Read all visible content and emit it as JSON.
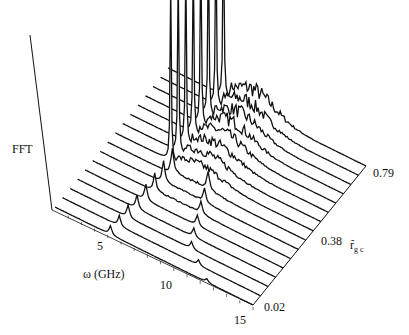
{
  "chart_data": {
    "type": "waterfall-3d",
    "title": "",
    "zlabel": "FFT",
    "xlabel": "ω (GHz)",
    "ylabel": "r̄_gc",
    "x_ticks": [
      5,
      10,
      15
    ],
    "x_tick_labels": [
      "5",
      "10",
      "15"
    ],
    "x_range": [
      0,
      15
    ],
    "y_ticks": [
      0.02,
      0.38,
      0.79
    ],
    "y_tick_labels": [
      "0.02",
      "0.38",
      "0.79"
    ],
    "y_range": [
      0.02,
      0.79
    ],
    "grid": false,
    "legend": null,
    "series_count": 16,
    "series": [
      {
        "r_gc": 0.02,
        "peaks": [
          {
            "omega": 4.2,
            "amp": 0.05
          },
          {
            "omega": 11.5,
            "amp": 0.02
          }
        ],
        "noise": 0.0
      },
      {
        "r_gc": 0.07,
        "peaks": [
          {
            "omega": 4.3,
            "amp": 0.06
          },
          {
            "omega": 10.3,
            "amp": 0.03
          }
        ],
        "noise": 0.0
      },
      {
        "r_gc": 0.12,
        "peaks": [
          {
            "omega": 4.4,
            "amp": 0.07
          },
          {
            "omega": 9.2,
            "amp": 0.04
          }
        ],
        "noise": 0.0
      },
      {
        "r_gc": 0.17,
        "peaks": [
          {
            "omega": 4.5,
            "amp": 0.08
          },
          {
            "omega": 8.8,
            "amp": 0.05
          }
        ],
        "noise": 0.0
      },
      {
        "r_gc": 0.22,
        "peaks": [
          {
            "omega": 4.6,
            "amp": 0.09
          },
          {
            "omega": 8.5,
            "amp": 0.06
          }
        ],
        "noise": 0.0
      },
      {
        "r_gc": 0.27,
        "peaks": [
          {
            "omega": 4.7,
            "amp": 0.1
          },
          {
            "omega": 8.2,
            "amp": 0.07
          }
        ],
        "noise": 0.01
      },
      {
        "r_gc": 0.33,
        "peaks": [
          {
            "omega": 4.8,
            "amp": 0.12
          },
          {
            "omega": 7.9,
            "amp": 0.08
          }
        ],
        "noise": 0.01
      },
      {
        "r_gc": 0.38,
        "peaks": [
          {
            "omega": 4.9,
            "amp": 0.14
          },
          {
            "omega": 7.6,
            "amp": 0.1
          }
        ],
        "noise": 0.02
      },
      {
        "r_gc": 0.43,
        "peaks": [
          {
            "omega": 4.2,
            "amp": 1.0
          }
        ],
        "noise": 0.06
      },
      {
        "r_gc": 0.48,
        "peaks": [
          {
            "omega": 4.2,
            "amp": 1.0
          }
        ],
        "noise": 0.07
      },
      {
        "r_gc": 0.53,
        "peaks": [
          {
            "omega": 4.2,
            "amp": 1.0
          }
        ],
        "noise": 0.08
      },
      {
        "r_gc": 0.58,
        "peaks": [
          {
            "omega": 4.2,
            "amp": 1.0
          }
        ],
        "noise": 0.09
      },
      {
        "r_gc": 0.63,
        "peaks": [
          {
            "omega": 4.2,
            "amp": 1.0
          }
        ],
        "noise": 0.1
      },
      {
        "r_gc": 0.68,
        "peaks": [
          {
            "omega": 4.2,
            "amp": 1.0
          }
        ],
        "noise": 0.1
      },
      {
        "r_gc": 0.74,
        "peaks": [
          {
            "omega": 4.2,
            "amp": 1.0
          }
        ],
        "noise": 0.11
      },
      {
        "r_gc": 0.79,
        "peaks": [
          {
            "omega": 4.2,
            "amp": 1.0
          }
        ],
        "noise": 0.12
      }
    ]
  },
  "labels": {
    "fft": "FFT",
    "omega_axis": "ω (GHz)",
    "tick_5": "5",
    "tick_10": "10",
    "tick_15": "15",
    "r_002": "0.02",
    "r_038": "0.38",
    "r_079": "0.79",
    "rgc_main": "r",
    "rgc_sub": "g c",
    "rgc_bar": "-"
  },
  "colors": {
    "ink": "#111111",
    "background": "#ffffff"
  }
}
